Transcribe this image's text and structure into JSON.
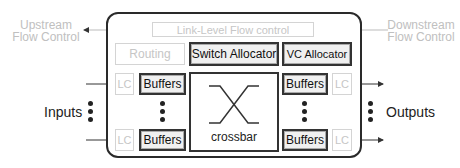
{
  "diagram": {
    "type": "router-microarchitecture",
    "left_labels": {
      "upstream": [
        "Upstream",
        "Flow Control"
      ],
      "inputs": "Inputs"
    },
    "right_labels": {
      "downstream": [
        "Downstream",
        "Flow Control"
      ],
      "outputs": "Outputs"
    },
    "router": {
      "link_level": "Link-Level Flow control",
      "routing": "Routing",
      "switch_allocator": "Switch Allocator",
      "vc_allocator": "VC Allocator",
      "crossbar": "crossbar",
      "input_ports": [
        {
          "lc": "LC",
          "buffers": "Buffers"
        },
        {
          "lc": "LC",
          "buffers": "Buffers"
        }
      ],
      "output_ports": [
        {
          "buffers": "Buffers",
          "lc": "LC"
        },
        {
          "buffers": "Buffers",
          "lc": "LC"
        }
      ]
    },
    "colors": {
      "dark": "#2a2a2a",
      "faint": "#c6c6c6",
      "box_fill": "#f0f0f0"
    }
  }
}
